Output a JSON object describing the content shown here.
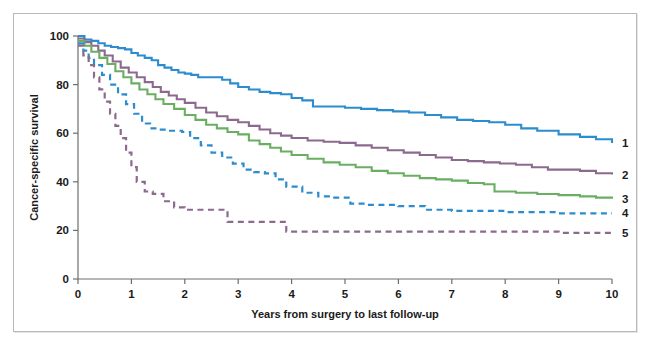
{
  "figure": {
    "border_color": "#b9b9b9",
    "background": "#ffffff"
  },
  "chart_data": {
    "type": "line",
    "title": "",
    "subtitle": "",
    "xlabel": "Years from surgery to last follow-up",
    "ylabel": "Cancer-specific survival",
    "xlim": [
      0,
      10
    ],
    "ylim": [
      0,
      100
    ],
    "xticks": [
      0,
      1,
      2,
      3,
      4,
      5,
      6,
      7,
      8,
      9,
      10
    ],
    "xticklabels": [
      "0",
      "1",
      "2",
      "3",
      "4",
      "5",
      "6",
      "7",
      "8",
      "9",
      "10"
    ],
    "yticks": [
      0,
      20,
      40,
      60,
      80,
      100
    ],
    "yticklabels": [
      "0",
      "20",
      "40",
      "60",
      "80",
      "100"
    ],
    "grid": false,
    "legend_position": "right-end-of-curves",
    "step_style": "post",
    "series": [
      {
        "name": "1",
        "label": "1",
        "color": "#2b8cce",
        "style": "solid",
        "end_value": 56,
        "x": [
          0,
          0.12,
          0.25,
          0.38,
          0.5,
          0.62,
          0.75,
          0.88,
          1.0,
          1.12,
          1.25,
          1.38,
          1.5,
          1.62,
          1.75,
          1.88,
          2.0,
          2.12,
          2.25,
          2.4,
          2.55,
          2.7,
          2.85,
          3.0,
          3.2,
          3.4,
          3.6,
          3.8,
          4.0,
          4.2,
          4.4,
          4.6,
          4.8,
          5.0,
          5.3,
          5.6,
          5.9,
          6.2,
          6.5,
          6.8,
          7.1,
          7.4,
          7.7,
          8.0,
          8.3,
          8.6,
          9.0,
          9.4,
          9.7,
          10.0
        ],
        "y": [
          100,
          98.5,
          98.0,
          97.0,
          96.0,
          95.5,
          95.0,
          94.5,
          93.0,
          92.0,
          91.0,
          90.0,
          88.0,
          87.0,
          86.0,
          85.0,
          84.5,
          84.0,
          83.0,
          83.0,
          83.0,
          82.0,
          80.5,
          79.0,
          78.0,
          77.0,
          76.5,
          76.0,
          74.5,
          73.5,
          71.0,
          71.0,
          71.0,
          70.5,
          70.0,
          69.5,
          69.0,
          68.5,
          67.5,
          66.5,
          65.5,
          65.0,
          64.5,
          63.5,
          62.0,
          61.0,
          59.5,
          58.5,
          57.5,
          56.0
        ]
      },
      {
        "name": "2",
        "label": "2",
        "color": "#8b6a8e",
        "style": "solid",
        "end_value": 43,
        "x": [
          0,
          0.12,
          0.25,
          0.38,
          0.5,
          0.65,
          0.8,
          0.95,
          1.1,
          1.25,
          1.4,
          1.55,
          1.7,
          1.85,
          2.0,
          2.2,
          2.4,
          2.6,
          2.8,
          3.0,
          3.2,
          3.4,
          3.6,
          3.8,
          4.0,
          4.3,
          4.6,
          4.9,
          5.2,
          5.5,
          5.8,
          6.1,
          6.4,
          6.7,
          7.0,
          7.3,
          7.6,
          7.9,
          8.2,
          8.5,
          8.8,
          9.1,
          9.4,
          9.7,
          10.0
        ],
        "y": [
          99,
          97.5,
          96.0,
          94.0,
          92.0,
          89.5,
          87.0,
          85.0,
          83.0,
          81.0,
          79.0,
          77.0,
          75.5,
          74.0,
          72.5,
          70.5,
          68.5,
          67.0,
          65.5,
          64.5,
          63.0,
          61.5,
          60.0,
          59.0,
          58.0,
          57.0,
          56.5,
          56.0,
          55.0,
          54.0,
          53.0,
          52.0,
          51.0,
          50.0,
          49.0,
          48.5,
          48.0,
          47.5,
          47.0,
          46.0,
          45.0,
          45.0,
          44.5,
          43.5,
          43.0
        ]
      },
      {
        "name": "3",
        "label": "3",
        "color": "#6aae62",
        "style": "solid",
        "end_value": 33,
        "x": [
          0,
          0.12,
          0.25,
          0.4,
          0.55,
          0.7,
          0.85,
          1.0,
          1.15,
          1.3,
          1.45,
          1.6,
          1.8,
          2.0,
          2.2,
          2.4,
          2.6,
          2.8,
          3.0,
          3.2,
          3.4,
          3.6,
          3.8,
          4.0,
          4.3,
          4.6,
          4.9,
          5.2,
          5.5,
          5.8,
          6.1,
          6.4,
          6.7,
          7.0,
          7.3,
          7.6,
          7.8,
          8.2,
          8.6,
          9.0,
          9.4,
          9.7,
          10.0
        ],
        "y": [
          98,
          96.0,
          93.5,
          91.0,
          88.5,
          85.5,
          83.0,
          80.5,
          78.0,
          76.0,
          74.0,
          72.0,
          70.0,
          67.5,
          65.5,
          63.5,
          62.0,
          60.5,
          59.5,
          57.0,
          55.5,
          54.0,
          52.5,
          51.0,
          49.5,
          48.0,
          47.0,
          46.0,
          44.5,
          43.5,
          42.5,
          41.5,
          41.0,
          40.5,
          39.5,
          39.0,
          36.0,
          35.5,
          35.0,
          34.5,
          34.0,
          33.5,
          33.0
        ]
      },
      {
        "name": "4",
        "label": "4",
        "color": "#2b8cce",
        "style": "dashed",
        "end_value": 27,
        "x": [
          0,
          0.1,
          0.2,
          0.3,
          0.45,
          0.6,
          0.75,
          0.9,
          1.05,
          1.2,
          1.35,
          1.5,
          1.65,
          1.8,
          1.95,
          2.1,
          2.3,
          2.5,
          2.7,
          2.9,
          3.1,
          3.3,
          3.5,
          3.7,
          3.9,
          4.2,
          4.5,
          4.8,
          5.1,
          5.4,
          5.7,
          6.0,
          6.5,
          7.0,
          7.5,
          8.0,
          8.5,
          9.0,
          9.5,
          10.0
        ],
        "y": [
          97,
          94.0,
          91.0,
          88.0,
          84.0,
          80.0,
          76.0,
          72.0,
          68.0,
          64.0,
          62.0,
          61.5,
          61.0,
          61.0,
          60.5,
          58.0,
          55.0,
          52.0,
          50.0,
          47.5,
          45.0,
          44.0,
          43.5,
          41.0,
          38.0,
          35.5,
          34.0,
          33.5,
          31.0,
          30.5,
          30.5,
          30.0,
          28.5,
          28.0,
          28.0,
          27.5,
          27.5,
          27.0,
          27.0,
          27.0
        ]
      },
      {
        "name": "5",
        "label": "5",
        "color": "#8b6a8e",
        "style": "dashed",
        "end_value": 19,
        "x": [
          0,
          0.1,
          0.2,
          0.3,
          0.4,
          0.5,
          0.6,
          0.7,
          0.8,
          0.9,
          1.0,
          1.1,
          1.25,
          1.4,
          1.6,
          1.8,
          2.0,
          2.2,
          2.4,
          2.6,
          2.75,
          2.8,
          3.0,
          3.2,
          3.4,
          3.6,
          3.8,
          3.9,
          4.2,
          4.6,
          5.0,
          5.5,
          6.0,
          6.5,
          7.0,
          7.5,
          8.0,
          8.5,
          9.0,
          9.5,
          10.0
        ],
        "y": [
          96,
          92.0,
          88.0,
          83.0,
          78.0,
          73.0,
          68.0,
          63.0,
          58.0,
          52.0,
          46.0,
          40.0,
          36.0,
          35.0,
          32.0,
          29.5,
          28.5,
          28.5,
          28.5,
          28.5,
          28.5,
          23.5,
          23.5,
          23.5,
          23.5,
          23.5,
          23.5,
          19.5,
          19.5,
          19.5,
          19.5,
          19.5,
          19.5,
          19.5,
          19.5,
          19.5,
          19.5,
          19.5,
          19.0,
          19.0,
          19.0
        ]
      }
    ]
  }
}
